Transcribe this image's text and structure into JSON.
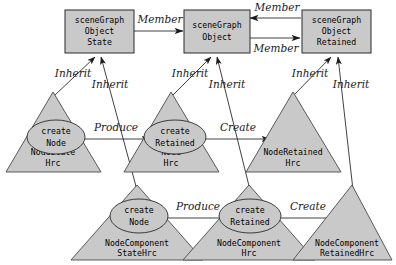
{
  "diagram": {
    "colors": {
      "shape_fill": "#c9c9c9",
      "shape_stroke": "#2b2b2b",
      "triangle_stroke": "#4a4a4a",
      "background": "#ffffff",
      "text": "#000000"
    },
    "boxes": [
      {
        "id": "scene-graph-object-state",
        "lines": [
          "sceneGraph",
          "Object",
          "State"
        ]
      },
      {
        "id": "scene-graph-object",
        "lines": [
          "sceneGraph",
          "Object"
        ]
      },
      {
        "id": "scene-graph-object-retained",
        "lines": [
          "sceneGraph",
          "Object",
          "Retained"
        ]
      }
    ],
    "triangles": [
      {
        "id": "node-state-hrc",
        "lines": [
          "NodeState",
          "Hrc"
        ],
        "ellipse": [
          "create",
          "Node"
        ]
      },
      {
        "id": "node-hrc",
        "lines": [
          "Node",
          "Hrc"
        ],
        "ellipse": [
          "create",
          "Retained"
        ]
      },
      {
        "id": "node-retained-hrc",
        "lines": [
          "NodeRetained",
          "Hrc"
        ],
        "ellipse": null
      },
      {
        "id": "node-component-state-hrc",
        "lines": [
          "NodeComponent",
          "StateHrc"
        ],
        "ellipse": [
          "create",
          "Node"
        ]
      },
      {
        "id": "node-component-hrc",
        "lines": [
          "NodeComponent",
          "Hrc"
        ],
        "ellipse": [
          "create",
          "Retained"
        ]
      },
      {
        "id": "node-component-retained-hrc",
        "lines": [
          "NodeComponent",
          "RetainedHrc"
        ],
        "ellipse": null
      }
    ],
    "edge_labels": {
      "member_state_to_object": "Member",
      "member_retained_to_object": "Member",
      "member_object_to_retained": "Member",
      "inherit_node_state_hrc": "Inherit",
      "inherit_node_component_state_hrc": "Inherit",
      "inherit_node_hrc": "Inherit",
      "inherit_node_component_hrc": "Inherit",
      "inherit_node_retained_hrc": "Inherit",
      "inherit_node_component_retained_hrc": "Inherit",
      "produce_top": "Produce",
      "create_top": "Create",
      "produce_bottom": "Produce",
      "create_bottom": "Create"
    }
  }
}
